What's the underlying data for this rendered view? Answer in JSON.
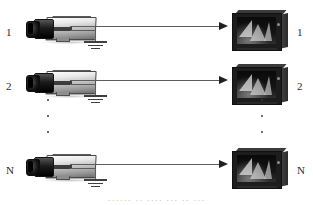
{
  "diagram": {
    "type": "block-diagram",
    "background_color": "#ffffff",
    "line_color": "#5d5d5d",
    "arrow_color": "#1f1f1f",
    "rows": [
      {
        "left_label": "1",
        "right_label": "1",
        "source_icon": "cctv-camera-icon",
        "sink_icon": "crt-monitor-icon",
        "link_icon": "signal-arrow-icon",
        "ground_icon": "earth-ground-icon"
      },
      {
        "left_label": "2",
        "right_label": "2",
        "source_icon": "cctv-camera-icon",
        "sink_icon": "crt-monitor-icon",
        "link_icon": "signal-arrow-icon",
        "ground_icon": "earth-ground-icon"
      },
      {
        "left_label": "N",
        "right_label": "N",
        "source_icon": "cctv-camera-icon",
        "sink_icon": "crt-monitor-icon",
        "link_icon": "signal-arrow-icon",
        "ground_icon": "earth-ground-icon"
      }
    ],
    "ellipsis": {
      "left_icon": "vertical-ellipsis-icon",
      "right_icon": "vertical-ellipsis-icon",
      "dot_count": 3
    },
    "caption": "······ ·· ···· ··· ·· ···"
  }
}
